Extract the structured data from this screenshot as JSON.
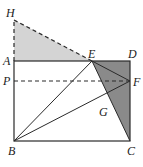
{
  "diagram": {
    "type": "geometry",
    "points": {
      "H": {
        "label": "H",
        "x": 14,
        "y": 20
      },
      "A": {
        "label": "A",
        "x": 14,
        "y": 61
      },
      "D": {
        "label": "D",
        "x": 130,
        "y": 61
      },
      "E": {
        "label": "E",
        "x": 92,
        "y": 61
      },
      "P": {
        "label": "P",
        "x": 14,
        "y": 81
      },
      "F": {
        "label": "F",
        "x": 130,
        "y": 81
      },
      "G": {
        "label": "G",
        "x": 103,
        "y": 105
      },
      "B": {
        "label": "B",
        "x": 14,
        "y": 141
      },
      "C": {
        "label": "C",
        "x": 130,
        "y": 141
      }
    },
    "colors": {
      "light_shade": "#d4d4d4",
      "dark_shade": "#8a8a8a",
      "stroke": "#2a2a2a"
    }
  }
}
